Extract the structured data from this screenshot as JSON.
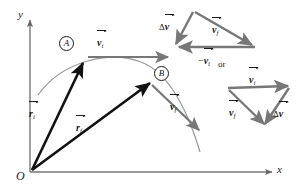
{
  "figure": {
    "colors": {
      "axis": "#666666",
      "trajectory": "#8a8a8a",
      "black_vector": "#111111",
      "gray_vector": "#777777",
      "text": "#1a1a1a"
    },
    "axes": {
      "y_label": "y",
      "x_label": "x",
      "origin_label": "O"
    },
    "points": [
      {
        "name": "point-a",
        "label": "A"
      },
      {
        "name": "point-b",
        "label": "B"
      }
    ],
    "main_vectors": [
      {
        "name": "r-initial",
        "symbol": "r",
        "subscript": "i",
        "prefix": "",
        "overbar": true
      },
      {
        "name": "r-final",
        "symbol": "r",
        "subscript": "f",
        "prefix": "",
        "overbar": true
      },
      {
        "name": "v-initial",
        "symbol": "v",
        "subscript": "i",
        "prefix": "",
        "overbar": true
      },
      {
        "name": "v-final",
        "symbol": "v",
        "subscript": "f",
        "prefix": "",
        "overbar": true
      }
    ],
    "triangle_top": {
      "name": "velocity-triangle-top",
      "labels": [
        {
          "name": "delta-v",
          "prefix": "Δ",
          "symbol": "v",
          "subscript": "",
          "overbar": true
        },
        {
          "name": "v-final",
          "prefix": "",
          "symbol": "v",
          "subscript": "f",
          "overbar": true
        },
        {
          "name": "neg-v-initial",
          "prefix": "−",
          "symbol": "v",
          "subscript": "i",
          "overbar": true
        }
      ]
    },
    "triangle_bottom": {
      "name": "velocity-triangle-bottom",
      "labels": [
        {
          "name": "v-initial",
          "prefix": "",
          "symbol": "v",
          "subscript": "i",
          "overbar": true
        },
        {
          "name": "v-final",
          "prefix": "",
          "symbol": "v",
          "subscript": "f",
          "overbar": true
        },
        {
          "name": "delta-v",
          "prefix": "Δ",
          "symbol": "v",
          "subscript": "",
          "overbar": true
        }
      ]
    },
    "connector": {
      "name": "or-text",
      "text": "or"
    }
  }
}
